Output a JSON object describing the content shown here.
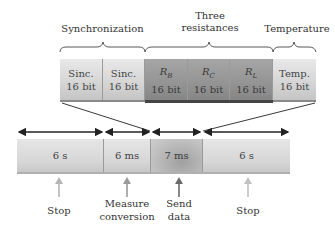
{
  "groups": [
    {
      "label": "Synchronization"
    },
    {
      "label_line1": "Three",
      "label_line2": "resistances"
    },
    {
      "label": "Temperature"
    }
  ],
  "top_fields": [
    {
      "name": "Sinc.",
      "sub": "",
      "bits": "16 bit",
      "shade": "light"
    },
    {
      "name": "Sinc.",
      "sub": "",
      "bits": "16 bit",
      "shade": "light"
    },
    {
      "name": "R",
      "sub": "B",
      "bits": "16 bit",
      "shade": "dark"
    },
    {
      "name": "R",
      "sub": "C",
      "bits": "16 bit",
      "shade": "dark"
    },
    {
      "name": "R",
      "sub": "L",
      "bits": "16 bit",
      "shade": "dark"
    },
    {
      "name": "Temp.",
      "sub": "",
      "bits": "16 bit",
      "shade": "light"
    }
  ],
  "timeline": [
    {
      "duration": "6 s",
      "label_line1": "Stop",
      "label_line2": "",
      "arrow_color": "#b5b5b5"
    },
    {
      "duration": "6 ms",
      "label_line1": "Measure",
      "label_line2": "conversion",
      "arrow_color": "#9a9a9a"
    },
    {
      "duration": "7 ms",
      "label_line1": "Send",
      "label_line2": "data",
      "arrow_color": "#6a6a6a"
    },
    {
      "duration": "6 s",
      "label_line1": "Stop",
      "label_line2": "",
      "arrow_color": "#c0c0c0"
    }
  ],
  "colors": {
    "light_box": "#d6d6d6",
    "dark_box": "#939393",
    "line": "#222222"
  }
}
